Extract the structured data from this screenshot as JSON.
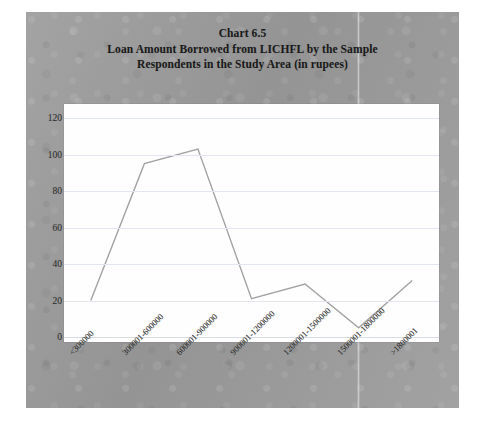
{
  "figure": {
    "title_lines": [
      "Chart  6.5",
      "Loan Amount Borrowed from LICHFL by the Sample",
      "Respondents in the Study Area (in rupees)"
    ],
    "background_color": "#9c9c9c",
    "plot_background_color": "#fefefe",
    "line_color": "#a3a3a3",
    "gridline_color": "#e2e6ee"
  },
  "chart_data": {
    "type": "line",
    "title": "Chart  6.5 Loan Amount Borrowed from LICHFL by the Sample Respondents in the Study Area (in rupees)",
    "xlabel": "",
    "ylabel": "",
    "categories": [
      "<300000",
      "300001-600000",
      "600001-900000",
      "900001-1200000",
      "1200001-1500000",
      "1500001-1800000",
      ">1800001"
    ],
    "values": [
      20,
      95,
      103,
      21,
      29,
      5,
      31
    ],
    "ylim": [
      0,
      120
    ],
    "ytick_step": 20,
    "yticks": [
      0,
      20,
      40,
      60,
      80,
      100,
      120
    ],
    "ytick_labels": [
      "0",
      "20",
      "40",
      "60",
      "80",
      "100",
      "120"
    ],
    "grid": true,
    "grid_axis": "y",
    "legend": false,
    "legend_position": "none",
    "series": [
      {
        "name": "Number of respondents",
        "values": [
          20,
          95,
          103,
          21,
          29,
          5,
          31
        ],
        "color": "#a3a3a3"
      }
    ]
  }
}
